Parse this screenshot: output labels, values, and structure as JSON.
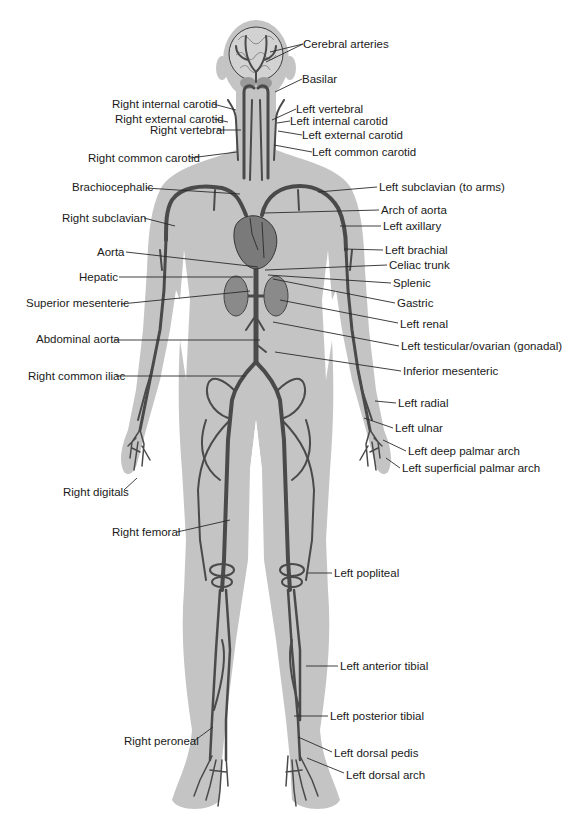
{
  "diagram": {
    "colors": {
      "background": "#ffffff",
      "silhouette": "#c4c4c4",
      "vessel": "#4a4a4a",
      "organ": "#6e6e6e",
      "leader": "#2a2a2a",
      "text": "#1a1a1a"
    },
    "labels": [
      {
        "id": "cerebral-arteries",
        "text": "Cerebral arteries",
        "x": 303,
        "y": 38,
        "align": "left",
        "lx1": 303,
        "ly1": 44,
        "lx2": 270,
        "ly2": 52
      },
      {
        "id": "basilar",
        "text": "Basilar",
        "x": 302,
        "y": 73,
        "align": "left",
        "lx1": 302,
        "ly1": 79,
        "lx2": 275,
        "ly2": 92
      },
      {
        "id": "right-internal-carotid",
        "text": "Right internal carotid",
        "x": 112,
        "y": 98,
        "align": "left",
        "lx1": 213,
        "ly1": 104,
        "lx2": 236,
        "ly2": 110
      },
      {
        "id": "right-external-carotid",
        "text": "Right external carotid",
        "x": 115,
        "y": 113,
        "align": "left",
        "lx1": 214,
        "ly1": 119,
        "lx2": 228,
        "ly2": 122
      },
      {
        "id": "right-vertebral",
        "text": "Right vertebral",
        "x": 150,
        "y": 124,
        "align": "left",
        "lx1": 217,
        "ly1": 130,
        "lx2": 241,
        "ly2": 130
      },
      {
        "id": "left-vertebral",
        "text": "Left vertebral",
        "x": 296,
        "y": 103,
        "align": "left",
        "lx1": 296,
        "ly1": 109,
        "lx2": 272,
        "ly2": 120
      },
      {
        "id": "left-internal-carotid",
        "text": "Left internal carotid",
        "x": 290,
        "y": 115,
        "align": "left",
        "lx1": 290,
        "ly1": 121,
        "lx2": 277,
        "ly2": 123
      },
      {
        "id": "left-external-carotid",
        "text": "Left external carotid",
        "x": 302,
        "y": 129,
        "align": "left",
        "lx1": 302,
        "ly1": 135,
        "lx2": 278,
        "ly2": 131
      },
      {
        "id": "right-common-carotid",
        "text": "Right common carotid",
        "x": 88,
        "y": 152,
        "align": "left",
        "lx1": 190,
        "ly1": 158,
        "lx2": 237,
        "ly2": 152
      },
      {
        "id": "left-common-carotid",
        "text": "Left common carotid",
        "x": 312,
        "y": 146,
        "align": "left",
        "lx1": 312,
        "ly1": 152,
        "lx2": 274,
        "ly2": 145
      },
      {
        "id": "brachiocephalic",
        "text": "Brachiocephalic",
        "x": 72,
        "y": 181,
        "align": "left",
        "lx1": 146,
        "ly1": 188,
        "lx2": 240,
        "ly2": 194
      },
      {
        "id": "left-subclavian",
        "text": "Left subclavian (to arms)",
        "x": 379,
        "y": 181,
        "align": "left",
        "lx1": 377,
        "ly1": 187,
        "lx2": 318,
        "ly2": 192
      },
      {
        "id": "right-subclavian",
        "text": "Right subclavian",
        "x": 62,
        "y": 212,
        "align": "left",
        "lx1": 144,
        "ly1": 218,
        "lx2": 175,
        "ly2": 226
      },
      {
        "id": "arch-of-aorta",
        "text": "Arch of aorta",
        "x": 381,
        "y": 204,
        "align": "left",
        "lx1": 379,
        "ly1": 210,
        "lx2": 264,
        "ly2": 213
      },
      {
        "id": "left-axillary",
        "text": "Left axillary",
        "x": 383,
        "y": 220,
        "align": "left",
        "lx1": 381,
        "ly1": 226,
        "lx2": 340,
        "ly2": 226
      },
      {
        "id": "aorta",
        "text": "Aorta",
        "x": 97,
        "y": 246,
        "align": "left",
        "lx1": 126,
        "ly1": 252,
        "lx2": 258,
        "ly2": 267
      },
      {
        "id": "left-brachial",
        "text": "Left brachial",
        "x": 385,
        "y": 244,
        "align": "left",
        "lx1": 383,
        "ly1": 250,
        "lx2": 344,
        "ly2": 249
      },
      {
        "id": "celiac-trunk",
        "text": "Celiac trunk",
        "x": 389,
        "y": 259,
        "align": "left",
        "lx1": 387,
        "ly1": 265,
        "lx2": 265,
        "ly2": 270
      },
      {
        "id": "hepatic",
        "text": "Hepatic",
        "x": 79,
        "y": 271,
        "align": "left",
        "lx1": 119,
        "ly1": 277,
        "lx2": 253,
        "ly2": 277
      },
      {
        "id": "splenic",
        "text": "Splenic",
        "x": 393,
        "y": 277,
        "align": "left",
        "lx1": 391,
        "ly1": 283,
        "lx2": 268,
        "ly2": 275
      },
      {
        "id": "superior-mesenteric",
        "text": "Superior mesenteric",
        "x": 26,
        "y": 297,
        "align": "left",
        "lx1": 121,
        "ly1": 304,
        "lx2": 250,
        "ly2": 291
      },
      {
        "id": "gastric",
        "text": "Gastric",
        "x": 397,
        "y": 297,
        "align": "left",
        "lx1": 395,
        "ly1": 303,
        "lx2": 273,
        "ly2": 279
      },
      {
        "id": "left-renal",
        "text": "Left renal",
        "x": 400,
        "y": 318,
        "align": "left",
        "lx1": 398,
        "ly1": 323,
        "lx2": 280,
        "ly2": 300
      },
      {
        "id": "abdominal-aorta",
        "text": "Abdominal aorta",
        "x": 36,
        "y": 333,
        "align": "left",
        "lx1": 114,
        "ly1": 340,
        "lx2": 260,
        "ly2": 340
      },
      {
        "id": "left-testicular-ovarian",
        "text": "Left testicular/ovarian (gonadal)",
        "x": 401,
        "y": 340,
        "align": "left",
        "lx1": 399,
        "ly1": 346,
        "lx2": 273,
        "ly2": 322
      },
      {
        "id": "inferior-mesenteric",
        "text": "Inferior mesenteric",
        "x": 403,
        "y": 365,
        "align": "left",
        "lx1": 401,
        "ly1": 371,
        "lx2": 275,
        "ly2": 352
      },
      {
        "id": "right-common-iliac",
        "text": "Right common iliac",
        "x": 28,
        "y": 370,
        "align": "left",
        "lx1": 116,
        "ly1": 376,
        "lx2": 245,
        "ly2": 376
      },
      {
        "id": "left-radial",
        "text": "Left radial",
        "x": 398,
        "y": 397,
        "align": "left",
        "lx1": 396,
        "ly1": 403,
        "lx2": 375,
        "ly2": 401
      },
      {
        "id": "left-ulnar",
        "text": "Left ulnar",
        "x": 395,
        "y": 422,
        "align": "left",
        "lx1": 393,
        "ly1": 428,
        "lx2": 364,
        "ly2": 418
      },
      {
        "id": "left-deep-palmar-arch",
        "text": "Left deep palmar arch",
        "x": 408,
        "y": 445,
        "align": "left",
        "lx1": 406,
        "ly1": 451,
        "lx2": 383,
        "ly2": 440
      },
      {
        "id": "left-superficial-palmar-arch",
        "text": "Left superficial palmar arch",
        "x": 402,
        "y": 462,
        "align": "left",
        "lx1": 400,
        "ly1": 468,
        "lx2": 386,
        "ly2": 458
      },
      {
        "id": "right-digitals",
        "text": "Right digitals",
        "x": 63,
        "y": 486,
        "align": "left",
        "lx1": 124,
        "ly1": 490,
        "lx2": 137,
        "ly2": 478
      },
      {
        "id": "right-femoral",
        "text": "Right femoral",
        "x": 112,
        "y": 526,
        "align": "left",
        "lx1": 177,
        "ly1": 532,
        "lx2": 230,
        "ly2": 520
      },
      {
        "id": "left-popliteal",
        "text": "Left popliteal",
        "x": 334,
        "y": 567,
        "align": "left",
        "lx1": 332,
        "ly1": 573,
        "lx2": 308,
        "ly2": 573
      },
      {
        "id": "left-anterior-tibial",
        "text": "Left anterior tibial",
        "x": 340,
        "y": 660,
        "align": "left",
        "lx1": 338,
        "ly1": 666,
        "lx2": 306,
        "ly2": 666
      },
      {
        "id": "left-posterior-tibial",
        "text": "Left posterior tibial",
        "x": 330,
        "y": 710,
        "align": "left",
        "lx1": 328,
        "ly1": 716,
        "lx2": 294,
        "ly2": 716
      },
      {
        "id": "right-peroneal",
        "text": "Right peroneal",
        "x": 124,
        "y": 735,
        "align": "left",
        "lx1": 194,
        "ly1": 741,
        "lx2": 213,
        "ly2": 727
      },
      {
        "id": "left-dorsal-pedis",
        "text": "Left dorsal pedis",
        "x": 334,
        "y": 747,
        "align": "left",
        "lx1": 332,
        "ly1": 752,
        "lx2": 298,
        "ly2": 737
      },
      {
        "id": "left-dorsal-arch",
        "text": "Left dorsal arch",
        "x": 346,
        "y": 769,
        "align": "left",
        "lx1": 344,
        "ly1": 773,
        "lx2": 307,
        "ly2": 758
      }
    ]
  }
}
